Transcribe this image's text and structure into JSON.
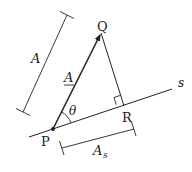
{
  "diagram": {
    "type": "vector-projection",
    "labels": {
      "point_p": "P",
      "point_q": "Q",
      "point_r": "R",
      "line_s": "s",
      "vector_a": "A",
      "magnitude_a": "A",
      "angle": "θ",
      "projection_main": "A",
      "projection_sub": "s"
    },
    "colors": {
      "stroke": "#222222",
      "background": "#ffffff"
    }
  }
}
